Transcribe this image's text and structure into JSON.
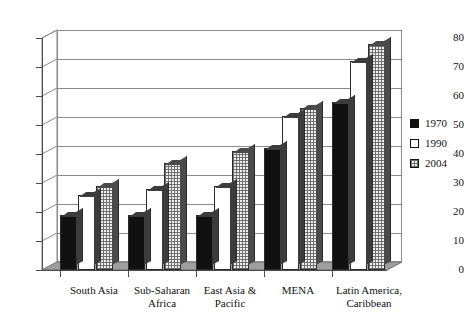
{
  "chart_data": {
    "type": "bar",
    "title": "",
    "subtitle": "",
    "xlabel": "",
    "ylabel": "",
    "ylim": [
      0,
      80
    ],
    "ytick_step": 10,
    "yticks": [
      "0",
      "10",
      "20",
      "30",
      "40",
      "50",
      "60",
      "70",
      "80"
    ],
    "grid": true,
    "legend_position": "right",
    "style": "3d-clustered-column",
    "categories": [
      "South Asia",
      "Sub-Saharan Africa",
      "East Asia & Pacific",
      "MENA",
      "Latin America, Caribbean"
    ],
    "category_lines": [
      [
        "South Asia"
      ],
      [
        "Sub-Saharan",
        "Africa"
      ],
      [
        "East Asia &",
        "Pacific"
      ],
      [
        "MENA"
      ],
      [
        "Latin America,",
        "Caribbean"
      ]
    ],
    "series": [
      {
        "name": "1970",
        "values": [
          19,
          19,
          19,
          42,
          58
        ],
        "fill": "solid-black",
        "color": "#111111"
      },
      {
        "name": "1990",
        "values": [
          26,
          28,
          29,
          53,
          72
        ],
        "fill": "white",
        "color": "#ffffff"
      },
      {
        "name": "2004",
        "values": [
          29,
          37,
          41,
          56,
          78
        ],
        "fill": "dotted-gray",
        "color": "#efefef"
      }
    ]
  },
  "legend": {
    "entries": [
      {
        "label": "1970"
      },
      {
        "label": "1990"
      },
      {
        "label": "2004"
      }
    ]
  },
  "colors": {
    "series_1970": "#111111",
    "series_1990": "#ffffff",
    "series_2004": "#efefef",
    "axis": "#4a4a4a",
    "gridline": "#8a8a8a",
    "floor": "#9e9e9e",
    "background": "#ffffff"
  }
}
